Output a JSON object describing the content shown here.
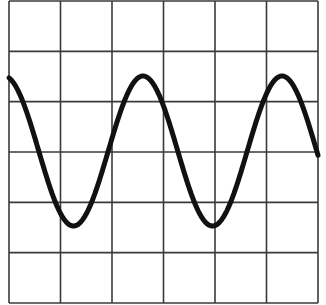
{
  "diagram": {
    "type": "sine-wave-on-grid",
    "grid": {
      "columns": 6,
      "rows": 6,
      "left": 9,
      "top": 1,
      "right": 318,
      "bottom": 303,
      "line_color": "#3a3a3a",
      "line_width": 1.6
    },
    "wave": {
      "color": "#111111",
      "stroke_width": 5,
      "center_y": 151,
      "amplitude_px": 75,
      "period_px": 139,
      "peak_x": 143,
      "x_start": 9,
      "x_end": 318,
      "peaks_x": [
        143,
        282
      ],
      "troughs_x": [
        75,
        214
      ]
    }
  }
}
